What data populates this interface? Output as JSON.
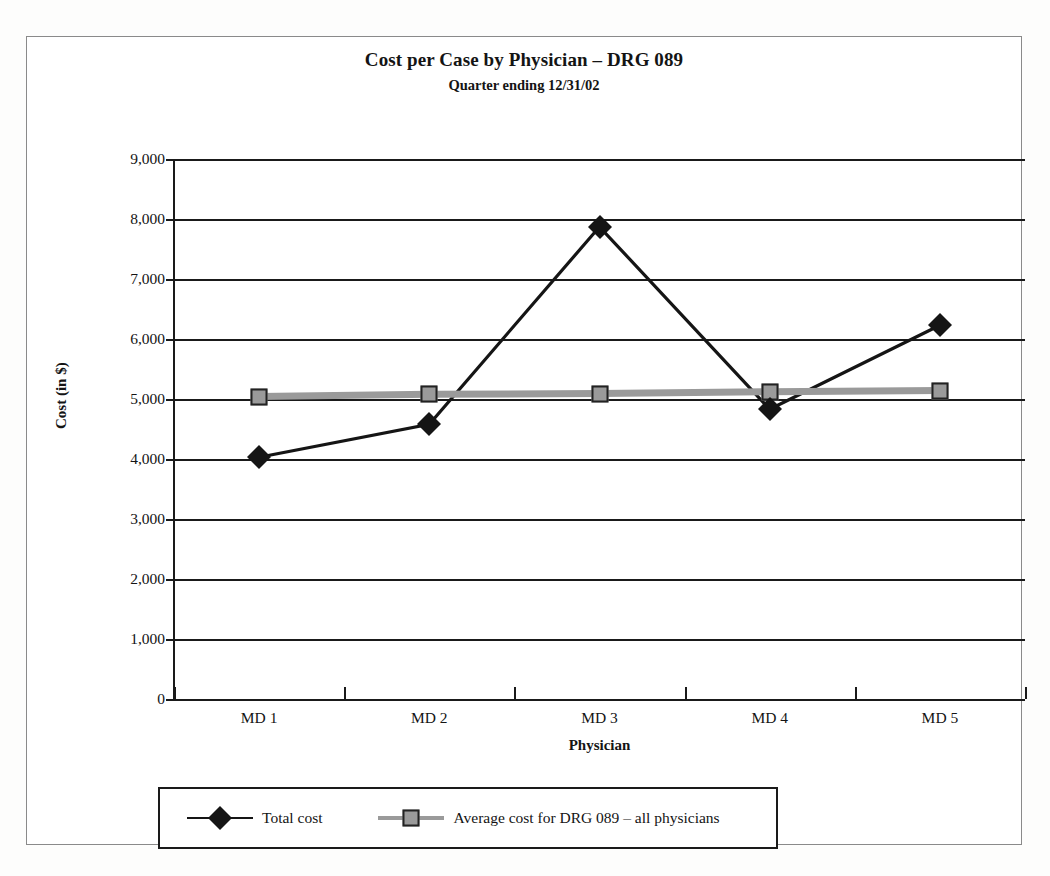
{
  "chart_data": {
    "type": "line",
    "title": "Cost per Case by Physician – DRG 089",
    "subtitle": "Quarter ending 12/31/02",
    "xlabel": "Physician",
    "ylabel": "Cost (in $)",
    "categories": [
      "MD 1",
      "MD 2",
      "MD 3",
      "MD 4",
      "MD 5"
    ],
    "ylim": [
      0,
      9000
    ],
    "ytick_values": [
      0,
      1000,
      2000,
      3000,
      4000,
      5000,
      6000,
      7000,
      8000,
      9000
    ],
    "ytick_labels": [
      "0",
      "1,000",
      "2,000",
      "3,000",
      "4,000",
      "5,000",
      "6,000",
      "7,000",
      "8,000",
      "9,000"
    ],
    "grid": true,
    "legend_position": "bottom",
    "series": [
      {
        "name": "Total cost",
        "marker": "diamond",
        "color": "#151515",
        "values": [
          4030,
          4580,
          7870,
          4830,
          6230
        ]
      },
      {
        "name": "Average cost for DRG 089 – all physicians",
        "marker": "square",
        "color": "#9a9a9a",
        "values": [
          5040,
          5080,
          5090,
          5120,
          5140
        ]
      }
    ]
  },
  "legend": {
    "entries": [
      {
        "label": "Total cost"
      },
      {
        "label": "Average cost for DRG 089 – all physicians"
      }
    ]
  },
  "colors": {
    "axis": "#1a1a1a",
    "total_cost": "#151515",
    "average_cost": "#9a9a9a",
    "background": "#ffffff"
  }
}
